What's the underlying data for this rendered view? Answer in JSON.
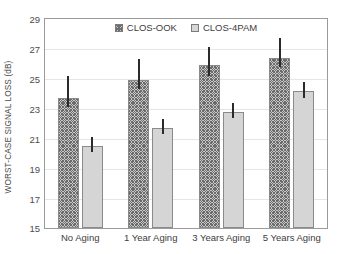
{
  "chart_data": {
    "type": "bar",
    "title": "",
    "xlabel": "",
    "ylabel": "WORST-CASE SIGNAL LOSS (dB)",
    "categories": [
      "No Aging",
      "1 Year Aging",
      "3 Years Aging",
      "5 Years Aging"
    ],
    "ylim": [
      15,
      29
    ],
    "yticks": [
      15,
      17,
      19,
      21,
      23,
      25,
      27,
      29
    ],
    "grid": true,
    "legend_position": "top-center",
    "series": [
      {
        "name": "CLOS-OOK",
        "values": [
          23.7,
          24.9,
          25.9,
          26.4
        ],
        "error_low": [
          23.1,
          24.3,
          25.2,
          25.8
        ],
        "error_high": [
          25.2,
          26.3,
          27.1,
          27.7
        ],
        "fill": "hatched"
      },
      {
        "name": "CLOS-4PAM",
        "values": [
          20.5,
          21.7,
          22.8,
          24.2
        ],
        "error_low": [
          20.1,
          21.3,
          22.4,
          23.7
        ],
        "error_high": [
          21.1,
          22.3,
          23.4,
          24.8
        ],
        "fill": "solid-gray"
      }
    ]
  },
  "axis": {
    "y_title": "WORST-CASE SIGNAL LOSS (dB)",
    "y_tick_labels": [
      "29",
      "27",
      "25",
      "23",
      "21",
      "19",
      "17",
      "15"
    ],
    "x_tick_labels": [
      "No Aging",
      "1 Year Aging",
      "3 Years Aging",
      "5 Years Aging"
    ]
  },
  "legend": {
    "items": [
      {
        "label": "CLOS-OOK",
        "swatch": "hatched-square-icon"
      },
      {
        "label": "CLOS-4PAM",
        "swatch": "gray-square-icon"
      }
    ]
  },
  "colors": {
    "frame": "#9b9b9b",
    "grid": "#e6e6e6",
    "bar_ook_fill": "#c7c7c7",
    "bar_ook_hatch": "#6b6b6b",
    "bar_pam_fill": "#d5d5d5",
    "bar_edge": "#8a8a8a",
    "errorbar": "#2b2b2b",
    "text": "#3d3d3d"
  }
}
